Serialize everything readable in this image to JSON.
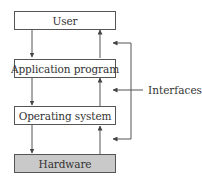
{
  "diagram": {
    "layers": [
      {
        "label": "User",
        "fill": "#ffffff"
      },
      {
        "label": "Application program",
        "fill": "#ffffff"
      },
      {
        "label": "Operating system",
        "fill": "#ffffff"
      },
      {
        "label": "Hardware",
        "fill": "#c9c9c9"
      }
    ],
    "interfaces_label": "Interfaces",
    "interface_count": 3,
    "colors": {
      "line": "#555555",
      "hardware_fill": "#c9c9c9"
    }
  }
}
